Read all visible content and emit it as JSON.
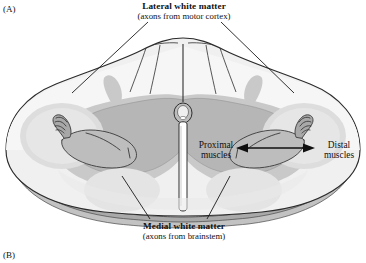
{
  "figure": {
    "panel_a_label": "(A)",
    "panel_b_label": "(B)"
  },
  "labels": {
    "lateral_white_matter": {
      "title": "Lateral white matter",
      "subtitle": "(axons from motor cortex)"
    },
    "medial_white_matter": {
      "title": "Medial white matter",
      "subtitle": "(axons from brainstem)"
    },
    "proximal_muscles": "Proximal\nmuscles",
    "proximal_muscles_line1": "Proximal",
    "proximal_muscles_line2": "muscles",
    "distal_muscles_line1": "Distal",
    "distal_muscles_line2": "muscles"
  },
  "colors": {
    "background": "#ffffff",
    "white_matter": "#ececec",
    "white_matter_light": "#f4f4f4",
    "gray_matter": "#b6b6b6",
    "gray_matter_mid": "#c9c9c9",
    "motor_pool": "#dcdcdc",
    "outline": "#2b2b2b",
    "slab_edge": "#a9a9a9",
    "slab_shadow": "#8f8f8f",
    "text": "#111111"
  },
  "annotations": {
    "arrow": {
      "type": "double-headed",
      "from": "proximal muscles",
      "to": "distal muscles",
      "x_start": 236,
      "x_end": 314,
      "y": 148
    },
    "leader_lines": [
      {
        "name": "lateral-left",
        "from": [
          148,
          22
        ],
        "to": [
          72,
          92
        ]
      },
      {
        "name": "lateral-right",
        "from": [
          222,
          22
        ],
        "to": [
          292,
          92
        ]
      },
      {
        "name": "medial-left",
        "from": [
          150,
          220
        ],
        "to": [
          120,
          178
        ]
      },
      {
        "name": "medial-right",
        "from": [
          206,
          220
        ],
        "to": [
          228,
          178
        ]
      }
    ]
  }
}
